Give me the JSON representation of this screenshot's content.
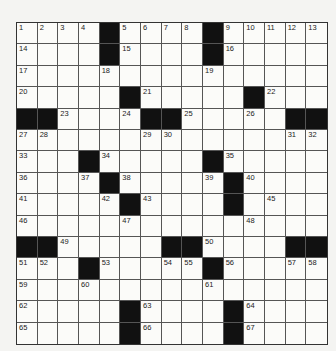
{
  "puzzle": {
    "rows": 15,
    "cols": 15,
    "layout": [
      "....#....#.....",
      "....#....#.....",
      "...............",
      ".....#.....#...",
      "##....##.....##",
      "...............",
      "...#.....#.....",
      "....#.....#....",
      ".....#....#....",
      "...............",
      "##.....##....##",
      "...#.....#.....",
      "...............",
      ".....#....#....",
      ".....#....#...."
    ],
    "numbers": [
      {
        "r": 0,
        "c": 0,
        "n": "1"
      },
      {
        "r": 0,
        "c": 1,
        "n": "2"
      },
      {
        "r": 0,
        "c": 2,
        "n": "3"
      },
      {
        "r": 0,
        "c": 3,
        "n": "4"
      },
      {
        "r": 0,
        "c": 5,
        "n": "5"
      },
      {
        "r": 0,
        "c": 6,
        "n": "6"
      },
      {
        "r": 0,
        "c": 7,
        "n": "7"
      },
      {
        "r": 0,
        "c": 8,
        "n": "8"
      },
      {
        "r": 0,
        "c": 10,
        "n": "9"
      },
      {
        "r": 0,
        "c": 11,
        "n": "10"
      },
      {
        "r": 0,
        "c": 12,
        "n": "11"
      },
      {
        "r": 0,
        "c": 13,
        "n": "12"
      },
      {
        "r": 0,
        "c": 14,
        "n": "13"
      },
      {
        "r": 1,
        "c": 0,
        "n": "14"
      },
      {
        "r": 1,
        "c": 5,
        "n": "15"
      },
      {
        "r": 1,
        "c": 10,
        "n": "16"
      },
      {
        "r": 2,
        "c": 0,
        "n": "17"
      },
      {
        "r": 2,
        "c": 4,
        "n": "18"
      },
      {
        "r": 2,
        "c": 9,
        "n": "19"
      },
      {
        "r": 3,
        "c": 0,
        "n": "20"
      },
      {
        "r": 3,
        "c": 6,
        "n": "21"
      },
      {
        "r": 3,
        "c": 12,
        "n": "22"
      },
      {
        "r": 4,
        "c": 2,
        "n": "23"
      },
      {
        "r": 4,
        "c": 5,
        "n": "24"
      },
      {
        "r": 4,
        "c": 8,
        "n": "25"
      },
      {
        "r": 4,
        "c": 11,
        "n": "26"
      },
      {
        "r": 5,
        "c": 0,
        "n": "27"
      },
      {
        "r": 5,
        "c": 1,
        "n": "28"
      },
      {
        "r": 5,
        "c": 6,
        "n": "29"
      },
      {
        "r": 5,
        "c": 7,
        "n": "30"
      },
      {
        "r": 5,
        "c": 13,
        "n": "31"
      },
      {
        "r": 5,
        "c": 14,
        "n": "32"
      },
      {
        "r": 6,
        "c": 0,
        "n": "33"
      },
      {
        "r": 6,
        "c": 4,
        "n": "34"
      },
      {
        "r": 6,
        "c": 10,
        "n": "35"
      },
      {
        "r": 7,
        "c": 0,
        "n": "36"
      },
      {
        "r": 7,
        "c": 3,
        "n": "37"
      },
      {
        "r": 7,
        "c": 5,
        "n": "38"
      },
      {
        "r": 7,
        "c": 9,
        "n": "39"
      },
      {
        "r": 7,
        "c": 11,
        "n": "40"
      },
      {
        "r": 8,
        "c": 0,
        "n": "41"
      },
      {
        "r": 8,
        "c": 4,
        "n": "42"
      },
      {
        "r": 8,
        "c": 6,
        "n": "43"
      },
      {
        "r": 8,
        "c": 10,
        "n": "44"
      },
      {
        "r": 8,
        "c": 12,
        "n": "45"
      },
      {
        "r": 9,
        "c": 0,
        "n": "46"
      },
      {
        "r": 9,
        "c": 5,
        "n": "47"
      },
      {
        "r": 9,
        "c": 11,
        "n": "48"
      },
      {
        "r": 10,
        "c": 2,
        "n": "49"
      },
      {
        "r": 10,
        "c": 9,
        "n": "50"
      },
      {
        "r": 11,
        "c": 0,
        "n": "51"
      },
      {
        "r": 11,
        "c": 1,
        "n": "52"
      },
      {
        "r": 11,
        "c": 4,
        "n": "53"
      },
      {
        "r": 11,
        "c": 7,
        "n": "54"
      },
      {
        "r": 11,
        "c": 8,
        "n": "55"
      },
      {
        "r": 11,
        "c": 10,
        "n": "56"
      },
      {
        "r": 11,
        "c": 13,
        "n": "57"
      },
      {
        "r": 11,
        "c": 14,
        "n": "58"
      },
      {
        "r": 12,
        "c": 0,
        "n": "59"
      },
      {
        "r": 12,
        "c": 3,
        "n": "60"
      },
      {
        "r": 12,
        "c": 9,
        "n": "61"
      },
      {
        "r": 13,
        "c": 0,
        "n": "62"
      },
      {
        "r": 13,
        "c": 6,
        "n": "63"
      },
      {
        "r": 13,
        "c": 11,
        "n": "64"
      },
      {
        "r": 14,
        "c": 0,
        "n": "65"
      },
      {
        "r": 14,
        "c": 6,
        "n": "66"
      },
      {
        "r": 14,
        "c": 11,
        "n": "67"
      }
    ]
  }
}
